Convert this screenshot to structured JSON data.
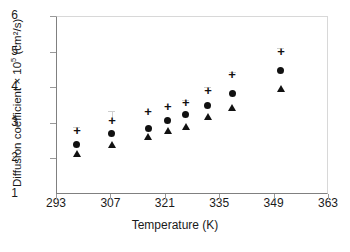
{
  "chart_data": {
    "type": "scatter",
    "title": "",
    "xlabel": "Temperature (K)",
    "ylabel": "Diffusion coefficient × 10⁵ (cm²/s)",
    "ylabel_main": "Diffusion coefficient",
    "ylabel_mult": "× 10",
    "ylabel_exp": "5",
    "ylabel_units": "(cm²/s)",
    "xlim": [
      293,
      363
    ],
    "ylim": [
      1,
      6
    ],
    "xticks": [
      293,
      307,
      321,
      335,
      349,
      363
    ],
    "yticks": [
      1,
      2,
      3,
      4,
      5,
      6
    ],
    "grid": false,
    "legend": "none",
    "x": [
      298.4,
      307.4,
      316.7,
      321.8,
      326.4,
      332.1,
      338.3,
      350.9
    ],
    "series": [
      {
        "name": "upper-series",
        "marker": "plus",
        "values": [
          2.76,
          3.04,
          3.29,
          3.44,
          3.55,
          3.9,
          4.34,
          4.99
        ],
        "err_upper": [
          0.12,
          0.3,
          0.0,
          0.0,
          0.1,
          0.1,
          0.08,
          0.12
        ]
      },
      {
        "name": "middle-series",
        "marker": "circle",
        "values": [
          2.38,
          2.69,
          2.85,
          3.07,
          3.22,
          3.48,
          3.81,
          4.46
        ],
        "err_upper": [
          0.0,
          0.0,
          0.0,
          0.0,
          0.0,
          0.0,
          0.0,
          0.0
        ]
      },
      {
        "name": "lower-series",
        "marker": "triangle",
        "values": [
          2.16,
          2.4,
          2.64,
          2.79,
          2.92,
          3.19,
          3.44,
          3.98
        ],
        "err_upper": [
          0.0,
          0.0,
          0.0,
          0.0,
          0.0,
          0.0,
          0.0,
          0.0
        ]
      }
    ]
  }
}
